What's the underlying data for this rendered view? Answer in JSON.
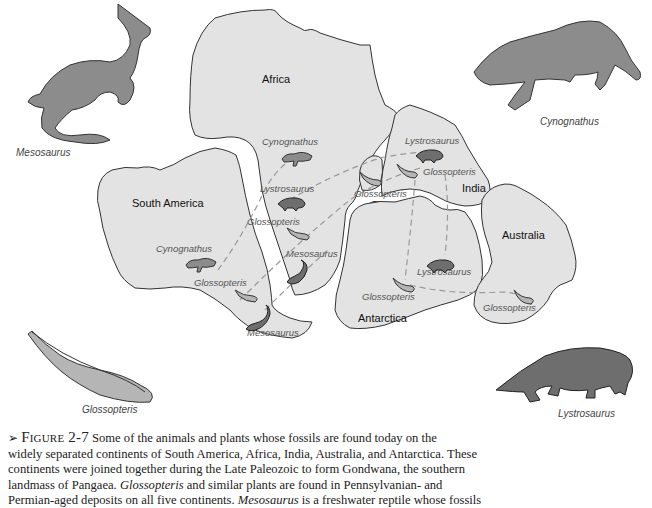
{
  "continents": {
    "africa": "Africa",
    "south_america": "South America",
    "india": "India",
    "australia": "Australia",
    "antarctica": "Antarctica"
  },
  "fossil_labels": {
    "africa_cynognathus": "Cynognathus",
    "africa_lystrosaurus": "Lystrosaurus",
    "africa_glossopteris": "Glossopteris",
    "africa_mesosaurus": "Mesosaurus",
    "sa_cynognathus": "Cynognathus",
    "sa_glossopteris": "Glossopteris",
    "sa_mesosaurus": "Mesosaurus",
    "madagascar_glossopteris": "Glossopteris",
    "india_lystrosaurus": "Lystrosaurus",
    "india_glossopteris": "Glossopteris",
    "antarctica_lystrosaurus": "Lystrosaurus",
    "antarctica_glossopteris": "Glossopteris",
    "australia_glossopteris": "Glossopteris"
  },
  "illustrations": {
    "mesosaurus": "Mesosaurus",
    "cynognathus": "Cynognathus",
    "glossopteris": "Glossopteris",
    "lystrosaurus": "Lystrosaurus"
  },
  "caption": {
    "arrow": "➢",
    "figure_label": "Figure 2-7",
    "line1_rest": " Some of the animals and plants whose fossils are found today on the",
    "line2": "widely separated continents of South America, Africa, India, Australia, and Antarctica. These",
    "line3": "continents were joined together during the Late Paleozoic to form Gondwana, the southern",
    "line4": "landmass of Pangaea. ",
    "line4_em": "Glossopteris",
    "line4_rest": " and similar plants are found in Pennsylvanian- and",
    "line5": "Permian-aged deposits on all five continents. ",
    "line5_em": "Mesosaurus",
    "line5_rest": " is a freshwater reptile whose fossils"
  },
  "colors": {
    "land": "#e3e3e3",
    "outline": "#333333",
    "animal": "#8c8c8c",
    "dashed_line": "#999999"
  }
}
